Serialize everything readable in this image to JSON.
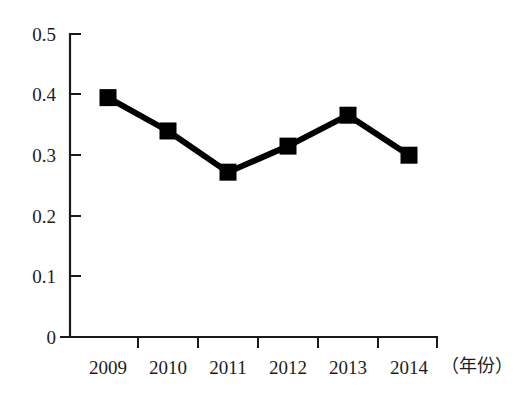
{
  "chart_data": {
    "type": "line",
    "title": "",
    "subtitle": "",
    "xlabel": "（年份）",
    "ylabel": "",
    "categories": [
      "2009",
      "2010",
      "2011",
      "2012",
      "2013",
      "2014"
    ],
    "values": [
      0.395,
      0.34,
      0.272,
      0.315,
      0.366,
      0.3
    ],
    "series": [
      {
        "name": "",
        "values": [
          0.395,
          0.34,
          0.272,
          0.315,
          0.366,
          0.3
        ]
      }
    ],
    "ylim": [
      0,
      0.5
    ],
    "yticks": [
      "0",
      "0.1",
      "0.2",
      "0.3",
      "0.4",
      "0.5"
    ],
    "ytick_values": [
      0,
      0.1,
      0.2,
      0.3,
      0.4,
      0.5
    ],
    "xticks": [
      "2009",
      "2010",
      "2011",
      "2012",
      "2013",
      "2014"
    ],
    "grid": false,
    "legend": false,
    "legend_position": "none",
    "marker": "square",
    "line_color": "#000000",
    "marker_color": "#000000",
    "annotations": []
  },
  "axis": {
    "y_tick_labels": [
      {
        "text": "0.5",
        "value": 0.5
      },
      {
        "text": "0.4",
        "value": 0.4
      },
      {
        "text": "0.3",
        "value": 0.3
      },
      {
        "text": "0.2",
        "value": 0.2
      },
      {
        "text": "0.1",
        "value": 0.1
      },
      {
        "text": "0",
        "value": 0
      }
    ],
    "x_tick_labels": [
      {
        "text": "2009"
      },
      {
        "text": "2010"
      },
      {
        "text": "2011"
      },
      {
        "text": "2012"
      },
      {
        "text": "2013"
      },
      {
        "text": "2014"
      }
    ],
    "x_axis_title": "（年份）"
  }
}
